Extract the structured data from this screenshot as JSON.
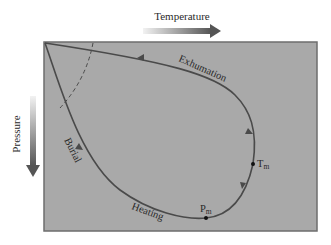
{
  "axes": {
    "x_label": "Temperature",
    "y_label": "Pressure"
  },
  "path_labels": {
    "burial": "Burial",
    "heating": "Heating",
    "exhumation": "Exhumation"
  },
  "points": {
    "pm": {
      "main": "P",
      "sub": "m"
    },
    "tm": {
      "main": "T",
      "sub": "m"
    }
  },
  "colors": {
    "panel_fill": "#a9a9a9",
    "panel_border": "#6e6e6e",
    "curve": "#4a4a4a",
    "arrow_dark": "#5a5a5a",
    "arrow_light": "#ededed",
    "text": "#2a2a2a"
  }
}
